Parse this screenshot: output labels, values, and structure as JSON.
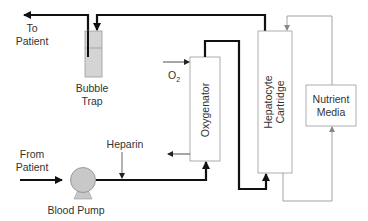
{
  "labels": {
    "to_patient_1": "To",
    "to_patient_2": "Patient",
    "bubble_trap_1": "Bubble",
    "bubble_trap_2": "Trap",
    "from_patient_1": "From",
    "from_patient_2": "Patient",
    "blood_pump": "Blood Pump",
    "heparin": "Heparin",
    "o2": "O",
    "o2_sub": "2",
    "oxygenator": "Oxygenator",
    "hepatocyte_1": "Hepatocyte",
    "hepatocyte_2": "Cartridge",
    "nutrient_1": "Nutrient",
    "nutrient_2": "Media"
  },
  "colors": {
    "thick_line": "#111111",
    "thin_line": "#999999",
    "box_stroke": "#999999",
    "trap_fill": "#d4d4d4",
    "pump_fill": "#c8c8c8",
    "text": "#333333"
  }
}
